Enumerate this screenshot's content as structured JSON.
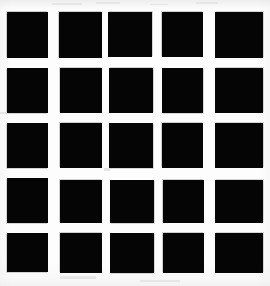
{
  "figure": {
    "canvas": {
      "width": 270,
      "height": 286
    },
    "background_color": "#fdfdfd",
    "square_color": "#050505",
    "rows": 5,
    "columns": 5,
    "total_squares": 25
  },
  "chart_data": {
    "type": "heatmap",
    "subtitle": "",
    "xlabel": "",
    "ylabel": "",
    "legend": [],
    "grid": false,
    "categories_x": [
      "c1",
      "c2",
      "c3",
      "c4",
      "c5"
    ],
    "categories_y": [
      "r1",
      "r2",
      "r3",
      "r4",
      "r5"
    ],
    "values": [
      [
        1,
        1,
        1,
        1,
        1
      ],
      [
        1,
        1,
        1,
        1,
        1
      ],
      [
        1,
        1,
        1,
        1,
        1
      ],
      [
        1,
        1,
        1,
        1,
        1
      ],
      [
        1,
        1,
        1,
        1,
        1
      ]
    ],
    "colors": {
      "filled": "#050505",
      "empty": "#fdfdfd"
    },
    "column_x": [
      7,
      59,
      108,
      162,
      215
    ],
    "column_width": [
      41,
      43,
      44,
      41,
      48
    ],
    "row_y": [
      12,
      68,
      123,
      178,
      233
    ],
    "row_height": [
      46,
      45,
      45,
      45,
      39
    ]
  },
  "cells": [
    {
      "id": "cell-r1c1",
      "row": 1,
      "col": 1,
      "x": 7,
      "y": 12,
      "w": 41,
      "h": 46,
      "edge": "edge-soft-tl"
    },
    {
      "id": "cell-r1c2",
      "row": 1,
      "col": 2,
      "x": 59,
      "y": 12,
      "w": 43,
      "h": 46,
      "edge": "edge-soft-tl"
    },
    {
      "id": "cell-r1c3",
      "row": 1,
      "col": 3,
      "x": 108,
      "y": 12,
      "w": 44,
      "h": 45,
      "edge": "edge-soft-tr"
    },
    {
      "id": "cell-r1c4",
      "row": 1,
      "col": 4,
      "x": 162,
      "y": 12,
      "w": 41,
      "h": 45,
      "edge": "edge-soft-tl"
    },
    {
      "id": "cell-r1c5",
      "row": 1,
      "col": 5,
      "x": 215,
      "y": 12,
      "w": 48,
      "h": 46,
      "edge": "edge-soft-tr"
    },
    {
      "id": "cell-r2c1",
      "row": 2,
      "col": 1,
      "x": 7,
      "y": 68,
      "w": 41,
      "h": 45,
      "edge": "edge-soft-bl"
    },
    {
      "id": "cell-r2c2",
      "row": 2,
      "col": 2,
      "x": 60,
      "y": 68,
      "w": 42,
      "h": 45,
      "edge": "edge-soft-tl"
    },
    {
      "id": "cell-r2c3",
      "row": 2,
      "col": 3,
      "x": 109,
      "y": 68,
      "w": 44,
      "h": 45,
      "edge": "edge-soft-tr"
    },
    {
      "id": "cell-r2c4",
      "row": 2,
      "col": 4,
      "x": 162,
      "y": 68,
      "w": 41,
      "h": 45,
      "edge": "edge-soft-br"
    },
    {
      "id": "cell-r2c5",
      "row": 2,
      "col": 5,
      "x": 215,
      "y": 68,
      "w": 48,
      "h": 45,
      "edge": "edge-soft-tr"
    },
    {
      "id": "cell-r3c1",
      "row": 3,
      "col": 1,
      "x": 7,
      "y": 123,
      "w": 41,
      "h": 45,
      "edge": "edge-soft-bl"
    },
    {
      "id": "cell-r3c2",
      "row": 3,
      "col": 2,
      "x": 60,
      "y": 123,
      "w": 42,
      "h": 45,
      "edge": "edge-soft-tl"
    },
    {
      "id": "cell-r3c3",
      "row": 3,
      "col": 3,
      "x": 109,
      "y": 123,
      "w": 44,
      "h": 45,
      "edge": "edge-soft-br"
    },
    {
      "id": "cell-r3c4",
      "row": 3,
      "col": 4,
      "x": 162,
      "y": 123,
      "w": 41,
      "h": 45,
      "edge": "edge-soft-tl"
    },
    {
      "id": "cell-r3c5",
      "row": 3,
      "col": 5,
      "x": 215,
      "y": 123,
      "w": 48,
      "h": 45,
      "edge": "edge-soft-tr"
    },
    {
      "id": "cell-r4c1",
      "row": 4,
      "col": 1,
      "x": 7,
      "y": 178,
      "w": 41,
      "h": 45,
      "edge": "edge-soft-bl"
    },
    {
      "id": "cell-r4c2",
      "row": 4,
      "col": 2,
      "x": 60,
      "y": 180,
      "w": 42,
      "h": 43,
      "edge": "edge-soft-tl"
    },
    {
      "id": "cell-r4c3",
      "row": 4,
      "col": 3,
      "x": 110,
      "y": 180,
      "w": 44,
      "h": 43,
      "edge": "edge-soft-br"
    },
    {
      "id": "cell-r4c4",
      "row": 4,
      "col": 4,
      "x": 163,
      "y": 180,
      "w": 41,
      "h": 43,
      "edge": "edge-soft-tl"
    },
    {
      "id": "cell-r4c5",
      "row": 4,
      "col": 5,
      "x": 215,
      "y": 180,
      "w": 48,
      "h": 43,
      "edge": "edge-soft-tr"
    },
    {
      "id": "cell-r5c1",
      "row": 5,
      "col": 1,
      "x": 7,
      "y": 233,
      "w": 41,
      "h": 39,
      "edge": "edge-soft-bl"
    },
    {
      "id": "cell-r5c2",
      "row": 5,
      "col": 2,
      "x": 60,
      "y": 233,
      "w": 42,
      "h": 40,
      "edge": "edge-soft-tl"
    },
    {
      "id": "cell-r5c3",
      "row": 5,
      "col": 3,
      "x": 110,
      "y": 233,
      "w": 44,
      "h": 40,
      "edge": "edge-soft-br"
    },
    {
      "id": "cell-r5c4",
      "row": 5,
      "col": 4,
      "x": 163,
      "y": 233,
      "w": 41,
      "h": 40,
      "edge": "edge-soft-tl"
    },
    {
      "id": "cell-r5c5",
      "row": 5,
      "col": 5,
      "x": 215,
      "y": 233,
      "w": 48,
      "h": 40,
      "edge": "edge-soft-tr"
    }
  ],
  "specks": [
    {
      "x": 52,
      "y": 3,
      "w": 30,
      "h": 2
    },
    {
      "x": 96,
      "y": 2,
      "w": 24,
      "h": 2
    },
    {
      "x": 150,
      "y": 4,
      "w": 18,
      "h": 1
    },
    {
      "x": 196,
      "y": 2,
      "w": 22,
      "h": 2
    },
    {
      "x": 108,
      "y": 30,
      "w": 8,
      "h": 5
    },
    {
      "x": 0,
      "y": 112,
      "w": 6,
      "h": 2
    },
    {
      "x": 104,
      "y": 168,
      "w": 6,
      "h": 3
    },
    {
      "x": 60,
      "y": 276,
      "w": 36,
      "h": 3
    },
    {
      "x": 140,
      "y": 280,
      "w": 40,
      "h": 2
    }
  ]
}
